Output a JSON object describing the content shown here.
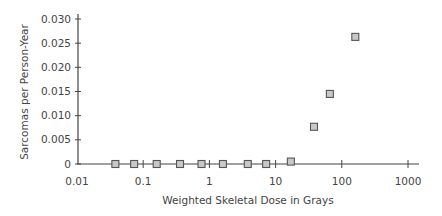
{
  "chart_data": {
    "type": "scatter",
    "title": "",
    "xlabel": "Weighted Skeletal Dose in Grays",
    "ylabel": "Sarcomas per Person-Year",
    "xscale": "log",
    "xlim": [
      0.01,
      1000
    ],
    "ylim": [
      0,
      0.03
    ],
    "x_ticks": [
      "0.01",
      "0.1",
      "1",
      "10",
      "100",
      "1000"
    ],
    "y_ticks": [
      "0",
      "0.005",
      "0.010",
      "0.015",
      "0.020",
      "0.025",
      "0.030"
    ],
    "grid": false,
    "legend": null,
    "marker": "square",
    "marker_color": "#c8c8c8",
    "series": [
      {
        "name": "Sarcoma incidence",
        "x": [
          0.038,
          0.073,
          0.16,
          0.36,
          0.76,
          1.6,
          3.8,
          7.2,
          17,
          38,
          66,
          160
        ],
        "y": [
          0,
          0,
          0,
          0,
          0,
          0,
          0,
          0,
          0.0005,
          0.0077,
          0.0145,
          0.0263
        ]
      }
    ]
  }
}
